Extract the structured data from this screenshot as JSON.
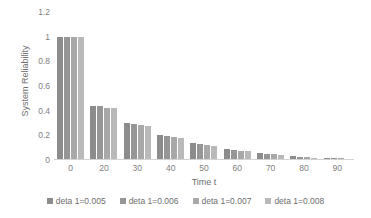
{
  "chart_data": {
    "type": "bar",
    "title": "",
    "subtitle": "",
    "xlabel": "Time t",
    "ylabel": "System Reliability",
    "categories": [
      "0",
      "20",
      "30",
      "40",
      "50",
      "60",
      "70",
      "80",
      "90"
    ],
    "ylim": [
      0,
      1.2
    ],
    "yticks": [
      "0",
      "0.2",
      "0.4",
      "0.6",
      "0.8",
      "1",
      "1.2"
    ],
    "ytick_values": [
      0,
      0.2,
      0.4,
      0.6,
      0.8,
      1,
      1.2
    ],
    "grid": false,
    "legend_position": "bottom",
    "orientation": "vertical",
    "series": [
      {
        "name": "deta 1=0.005",
        "color": "#8c8c8c",
        "values": [
          1,
          0.44,
          0.3,
          0.2,
          0.135,
          0.09,
          0.055,
          0.032,
          0.02
        ]
      },
      {
        "name": "deta 1=0.006",
        "color": "#969696",
        "values": [
          1,
          0.435,
          0.295,
          0.193,
          0.128,
          0.084,
          0.05,
          0.028,
          0.017
        ]
      },
      {
        "name": "deta 1=0.007",
        "color": "#a8a8a8",
        "values": [
          1,
          0.425,
          0.283,
          0.183,
          0.12,
          0.077,
          0.045,
          0.024,
          0.013
        ]
      },
      {
        "name": "deta 1=0.008",
        "color": "#b9b9b9",
        "values": [
          1,
          0.418,
          0.273,
          0.175,
          0.112,
          0.07,
          0.04,
          0.02,
          0.01
        ]
      }
    ]
  },
  "axes": {
    "y_title": "System Reliability",
    "x_title": "Time t",
    "axis_line_color": "#d3d3d3",
    "tick_text_color": "#808080"
  },
  "legend": {
    "items": [
      {
        "label": "deta 1=0.005",
        "color": "#8c8c8c"
      },
      {
        "label": "deta 1=0.006",
        "color": "#969696"
      },
      {
        "label": "deta 1=0.007",
        "color": "#a8a8a8"
      },
      {
        "label": "deta 1=0.008",
        "color": "#b9b9b9"
      }
    ]
  }
}
